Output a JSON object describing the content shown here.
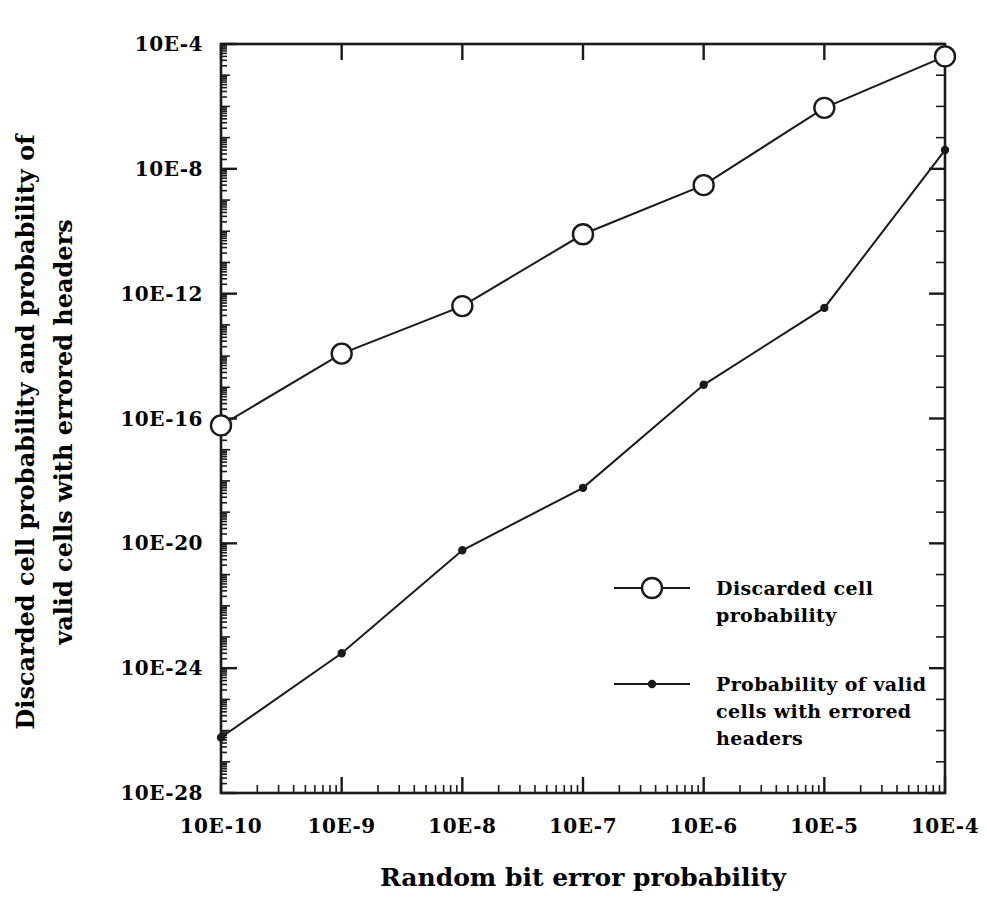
{
  "chart_data": {
    "type": "line",
    "title": "",
    "xlabel": "Random bit error probability",
    "ylabel": "Discarded cell probability and probability of valid cells with errored headers",
    "ylabel_line1": "Discarded cell probability and probability of",
    "ylabel_line2": "valid cells with errored headers",
    "xscale": "log",
    "yscale": "log",
    "grid": false,
    "legend_position": "center-right",
    "xlim": [
      1e-10,
      0.0001
    ],
    "ylim": [
      1e-28,
      0.0001
    ],
    "xticklabels": [
      "10E-10",
      "10E-9",
      "10E-8",
      "10E-7",
      "10E-6",
      "10E-5",
      "10E-4"
    ],
    "xtickvalues": [
      1e-10,
      1e-09,
      1e-08,
      1e-07,
      1e-06,
      1e-05,
      0.0001
    ],
    "yticklabels": [
      "10E-4",
      "10E-8",
      "10E-12",
      "10E-16",
      "10E-20",
      "10E-24",
      "10E-28"
    ],
    "ytickvalues": [
      0.0001,
      1e-08,
      1e-12,
      1e-16,
      1e-20,
      1e-24,
      1e-28
    ],
    "x": [
      1e-10,
      1e-09,
      1e-08,
      1e-07,
      1e-06,
      1e-05,
      0.0001
    ],
    "series": [
      {
        "name": "Discarded cell probability",
        "marker": "open-circle",
        "values": [
          6e-17,
          1.2e-14,
          4e-13,
          8e-11,
          3e-09,
          9e-07,
          4e-05
        ]
      },
      {
        "name": "Probability of valid cells with errored headers",
        "marker": "filled-dot",
        "values": [
          6e-27,
          3e-24,
          6e-21,
          6e-19,
          1.2e-15,
          3.5e-13,
          4e-08
        ]
      }
    ],
    "legend": [
      {
        "marker": "open-circle",
        "lines": [
          "Discarded cell",
          "probability"
        ]
      },
      {
        "marker": "filled-dot",
        "lines": [
          "Probability of valid",
          "cells with errored",
          "headers"
        ]
      }
    ],
    "colors": {
      "ink": "#1a1a1a",
      "background": "#ffffff"
    }
  }
}
